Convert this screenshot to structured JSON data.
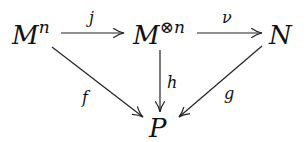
{
  "diagram": {
    "type": "commutative-diagram",
    "nodes": {
      "mn": {
        "base": "M",
        "sup": "n"
      },
      "motimesn": {
        "base": "M",
        "sup_symbol": "⊗",
        "sup": "n"
      },
      "n": {
        "label": "N"
      },
      "p": {
        "label": "P"
      }
    },
    "arrows": {
      "j": {
        "label": "j",
        "from": "M^n",
        "to": "M^⊗n"
      },
      "nu": {
        "label": "ν",
        "from": "M^⊗n",
        "to": "N"
      },
      "f": {
        "label": "f",
        "from": "M^n",
        "to": "P"
      },
      "h": {
        "label": "h",
        "from": "M^⊗n",
        "to": "P"
      },
      "g": {
        "label": "g",
        "from": "N",
        "to": "P"
      }
    },
    "colors": {
      "stroke": "#222222",
      "text": "#111111",
      "background": "#ffffff"
    }
  }
}
